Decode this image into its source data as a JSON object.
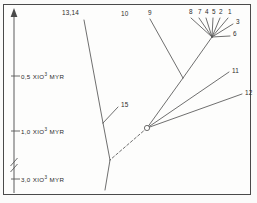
{
  "figure": {
    "type": "phylogenetic-tree",
    "background": "#fdfdfc",
    "frame_color": "#4a4a4a",
    "line_color": "#555555",
    "text_color": "#2b2b2b"
  },
  "axis": {
    "orientation": "vertical",
    "direction": "upward-arrow",
    "unit": "MYR",
    "has_break": true,
    "break_position_y": 164,
    "ticks": [
      {
        "label_value": "0,5",
        "multiplier": "XIO",
        "exponent": "3",
        "unit": "MYR",
        "full_label": "0,5 XIO3 MYR",
        "y": 76
      },
      {
        "label_value": "1,0",
        "multiplier": "XIO",
        "exponent": "3",
        "unit": "MYR",
        "full_label": "1,0 XIO3 MYR",
        "y": 131
      },
      {
        "label_value": "3,0",
        "multiplier": "XIO",
        "exponent": "3",
        "unit": "MYR",
        "full_label": "3,0 XIO3 MYR",
        "y": 179
      }
    ]
  },
  "tips": [
    {
      "id": "t1",
      "label": "1",
      "x": 228,
      "y": 12
    },
    {
      "id": "t2",
      "label": "2",
      "x": 219,
      "y": 12
    },
    {
      "id": "t3",
      "label": "3",
      "x": 236,
      "y": 22
    },
    {
      "id": "t4",
      "label": "4",
      "x": 205,
      "y": 12
    },
    {
      "id": "t5",
      "label": "5",
      "x": 212,
      "y": 12
    },
    {
      "id": "t6",
      "label": "6",
      "x": 233,
      "y": 34
    },
    {
      "id": "t7",
      "label": "7",
      "x": 198,
      "y": 12
    },
    {
      "id": "t8",
      "label": "8",
      "x": 189,
      "y": 12
    },
    {
      "id": "t9",
      "label": "9",
      "x": 148,
      "y": 13
    },
    {
      "id": "t10",
      "label": "10",
      "x": 121,
      "y": 14
    },
    {
      "id": "t11",
      "label": "11",
      "x": 232,
      "y": 71
    },
    {
      "id": "t12",
      "label": "12",
      "x": 245,
      "y": 93
    },
    {
      "id": "t13_14",
      "label": "13,14",
      "x": 62,
      "y": 13
    },
    {
      "id": "t15",
      "label": "15",
      "x": 121,
      "y": 105
    }
  ],
  "nodes": [
    {
      "id": "root",
      "type": "circle-marker",
      "x": 147,
      "y": 128
    },
    {
      "id": "crown",
      "type": "junction",
      "x": 212,
      "y": 37
    },
    {
      "id": "mid",
      "type": "junction",
      "x": 183,
      "y": 78
    },
    {
      "id": "node15",
      "type": "junction",
      "x": 103,
      "y": 123
    },
    {
      "id": "basal1314",
      "type": "junction",
      "x": 110,
      "y": 160
    }
  ],
  "branches": [
    {
      "name": "branch-1",
      "from": [
        212,
        37
      ],
      "to": [
        228,
        18
      ],
      "style": "solid"
    },
    {
      "name": "branch-2",
      "from": [
        212,
        37
      ],
      "to": [
        220,
        18
      ],
      "style": "solid"
    },
    {
      "name": "branch-3",
      "from": [
        212,
        37
      ],
      "to": [
        233,
        24
      ],
      "style": "solid"
    },
    {
      "name": "branch-4",
      "from": [
        212,
        37
      ],
      "to": [
        206,
        18
      ],
      "style": "solid"
    },
    {
      "name": "branch-5",
      "from": [
        212,
        37
      ],
      "to": [
        213,
        18
      ],
      "style": "solid"
    },
    {
      "name": "branch-6",
      "from": [
        212,
        37
      ],
      "to": [
        230,
        36
      ],
      "style": "solid"
    },
    {
      "name": "branch-7",
      "from": [
        212,
        37
      ],
      "to": [
        199,
        18
      ],
      "style": "solid"
    },
    {
      "name": "branch-8",
      "from": [
        212,
        37
      ],
      "to": [
        191,
        18
      ],
      "style": "solid"
    },
    {
      "name": "branch-crown-stem",
      "from": [
        212,
        37
      ],
      "to": [
        183,
        78
      ],
      "style": "solid"
    },
    {
      "name": "branch-9",
      "from": [
        183,
        78
      ],
      "to": [
        150,
        19
      ],
      "style": "solid"
    },
    {
      "name": "branch-mid-stem",
      "from": [
        183,
        78
      ],
      "to": [
        147,
        128
      ],
      "style": "solid"
    },
    {
      "name": "branch-11",
      "from": [
        147,
        128
      ],
      "to": [
        229,
        72
      ],
      "style": "solid"
    },
    {
      "name": "branch-12",
      "from": [
        147,
        128
      ],
      "to": [
        242,
        94
      ],
      "style": "solid"
    },
    {
      "name": "branch-root-dashed",
      "from": [
        147,
        128
      ],
      "to": [
        110,
        160
      ],
      "style": "dashed"
    },
    {
      "name": "branch-1314-stem",
      "from": [
        110,
        160
      ],
      "to": [
        103,
        123
      ],
      "style": "solid"
    },
    {
      "name": "branch-1314-upper",
      "from": [
        103,
        123
      ],
      "to": [
        84,
        20
      ],
      "style": "solid"
    },
    {
      "name": "branch-15",
      "from": [
        103,
        123
      ],
      "to": [
        118,
        107
      ],
      "style": "solid"
    },
    {
      "name": "branch-1314-lower",
      "from": [
        110,
        160
      ],
      "to": [
        105,
        190
      ],
      "style": "solid"
    }
  ]
}
